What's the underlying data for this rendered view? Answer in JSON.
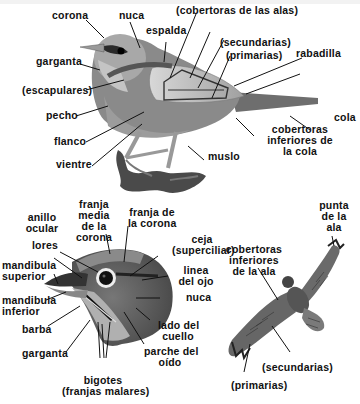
{
  "diagram": {
    "songbird": {
      "labels": {
        "corona": "corona",
        "nuca": "nuca",
        "cobertoras_alas": "(cobertoras de las alas)",
        "espalda": "espalda",
        "secundarias": "(secundarias)",
        "primarias": "(primarias)",
        "rabadilla": "rabadilla",
        "garganta": "garganta",
        "escapulares": "(escapulares)",
        "pecho": "pecho",
        "cola": "cola",
        "flanco": "flanco",
        "cobertoras_cola_1": "cobertoras",
        "cobertoras_cola_2": "inferiores de",
        "cobertoras_cola_3": "la cola",
        "vientre": "vientre",
        "muslo": "muslo"
      }
    },
    "head": {
      "labels": {
        "anillo_1": "anillo",
        "anillo_2": "ocular",
        "franja_media_1": "franja",
        "franja_media_2": "media",
        "franja_media_3": "de la",
        "franja_media_4": "corona",
        "franja_corona_1": "franja de",
        "franja_corona_2": "la corona",
        "lores": "lores",
        "ceja_1": "ceja",
        "ceja_2": "(superciliar)",
        "mandibula_sup_1": "mandibula",
        "mandibula_sup_2": "superior",
        "linea_ojo_1": "linea",
        "linea_ojo_2": "del ojo",
        "nuca": "nuca",
        "mandibula_inf_1": "mandibula",
        "mandibula_inf_2": "inferior",
        "barba": "barba",
        "lado_cuello_1": "lado del",
        "lado_cuello_2": "cuello",
        "garganta": "garganta",
        "parche_1": "parche del",
        "parche_2": "oído",
        "bigotes_1": "bigotes",
        "bigotes_2": "(franjas malares)"
      }
    },
    "hawk": {
      "labels": {
        "punta_1": "punta",
        "punta_2": "de la",
        "punta_3": "ala",
        "cob_ala_1": "cobertoras",
        "cob_ala_2": "inferiores",
        "cob_ala_3": "de la ala",
        "secundarias": "(secundarias)",
        "primarias": "(primarias)"
      }
    },
    "colors": {
      "line": "#111111",
      "bird_dark": "#5a5a5a",
      "bird_mid": "#8c8c8c",
      "bird_light": "#c8c8c8",
      "background": "#ffffff"
    }
  }
}
